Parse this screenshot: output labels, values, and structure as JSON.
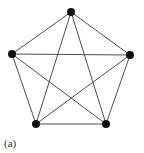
{
  "figure": {
    "caption": "(a)",
    "graph_name": "complete-graph-K5",
    "colors": {
      "edge": "#3a3a3a",
      "vertex": "#111111",
      "background": "#ffffff"
    },
    "vertices": [
      {
        "id": "v1",
        "x": 71,
        "y": 12
      },
      {
        "id": "v2",
        "x": 130,
        "y": 55
      },
      {
        "id": "v3",
        "x": 106,
        "y": 124
      },
      {
        "id": "v4",
        "x": 36,
        "y": 124
      },
      {
        "id": "v5",
        "x": 12,
        "y": 54
      }
    ],
    "edges": [
      [
        "v1",
        "v2"
      ],
      [
        "v1",
        "v3"
      ],
      [
        "v1",
        "v4"
      ],
      [
        "v1",
        "v5"
      ],
      [
        "v2",
        "v3"
      ],
      [
        "v2",
        "v4"
      ],
      [
        "v2",
        "v5"
      ],
      [
        "v3",
        "v4"
      ],
      [
        "v3",
        "v5"
      ],
      [
        "v4",
        "v5"
      ]
    ],
    "vertex_radius": 4
  }
}
